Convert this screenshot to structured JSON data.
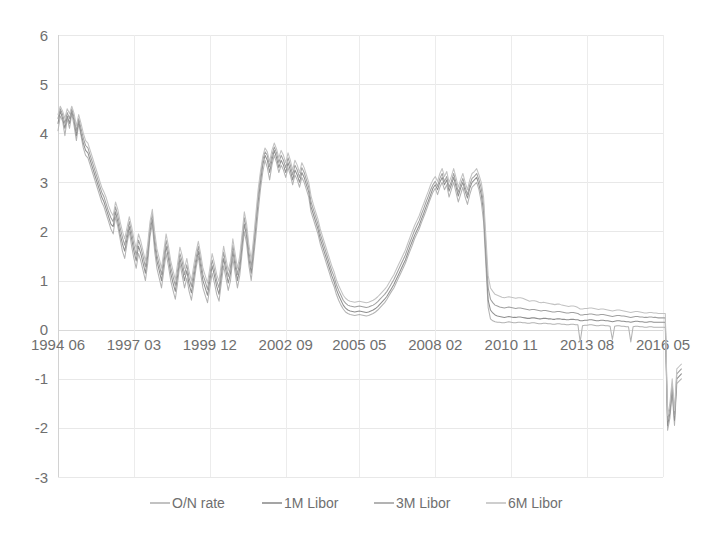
{
  "chart_data": {
    "type": "line",
    "title": "",
    "subtitle": "",
    "xlabel": "",
    "ylabel": "",
    "ylim": [
      -3,
      6
    ],
    "ytick_labels": [
      "6",
      "5",
      "4",
      "3",
      "2",
      "1",
      "0",
      "-1",
      "-2",
      "-3"
    ],
    "ytick_values": [
      6,
      5,
      4,
      3,
      2,
      1,
      0,
      -1,
      -2,
      -3
    ],
    "grid": true,
    "grid_axis": "both",
    "legend_position": "bottom",
    "xtick_labels": [
      "1994 06",
      "1997 03",
      "1999 12",
      "2002 09",
      "2005 05",
      "2008 02",
      "2010 11",
      "2013 08",
      "2016 05"
    ],
    "xtick_index": [
      0,
      33,
      66,
      99,
      131,
      164,
      197,
      230,
      263
    ],
    "x_axis_label_position": "at-zero-line",
    "n_points": 264,
    "x_start": "1994 06",
    "x_end": "2016 05",
    "series": [
      {
        "name": "O/N rate",
        "color": "#b3b3b3",
        "values": [
          4.05,
          4.35,
          4.25,
          3.95,
          4.3,
          4.1,
          4.4,
          4.15,
          3.85,
          4.2,
          3.95,
          3.7,
          3.55,
          3.5,
          3.35,
          3.2,
          3.05,
          2.9,
          2.75,
          2.6,
          2.5,
          2.35,
          2.2,
          2.05,
          1.95,
          2.3,
          2.1,
          1.85,
          1.6,
          1.45,
          1.75,
          2.0,
          1.7,
          1.45,
          1.25,
          1.55,
          1.4,
          1.2,
          1.0,
          1.35,
          1.9,
          2.15,
          1.6,
          1.25,
          1.05,
          0.85,
          1.2,
          1.55,
          1.3,
          1.0,
          0.8,
          0.62,
          0.95,
          1.35,
          1.1,
          0.85,
          1.05,
          0.78,
          0.6,
          0.9,
          1.25,
          1.5,
          1.15,
          0.85,
          0.7,
          0.55,
          0.85,
          1.15,
          0.95,
          0.72,
          0.58,
          0.95,
          1.3,
          1.05,
          0.8,
          1.0,
          1.45,
          1.15,
          0.85,
          1.1,
          1.55,
          2.0,
          1.75,
          1.3,
          1.0,
          1.45,
          1.9,
          2.4,
          2.85,
          3.2,
          3.45,
          3.3,
          3.05,
          3.35,
          3.55,
          3.4,
          3.2,
          3.35,
          3.25,
          3.1,
          3.3,
          3.15,
          2.95,
          3.15,
          3.05,
          2.9,
          3.1,
          3.0,
          2.85,
          2.7,
          2.4,
          2.25,
          2.1,
          1.95,
          1.75,
          1.6,
          1.45,
          1.3,
          1.15,
          1.0,
          0.88,
          0.72,
          0.6,
          0.5,
          0.42,
          0.36,
          0.33,
          0.31,
          0.3,
          0.29,
          0.3,
          0.31,
          0.3,
          0.29,
          0.28,
          0.29,
          0.31,
          0.33,
          0.36,
          0.4,
          0.45,
          0.5,
          0.55,
          0.62,
          0.7,
          0.78,
          0.85,
          0.95,
          1.05,
          1.15,
          1.25,
          1.35,
          1.48,
          1.6,
          1.72,
          1.85,
          1.95,
          2.05,
          2.18,
          2.3,
          2.42,
          2.55,
          2.68,
          2.8,
          2.88,
          2.75,
          2.9,
          3.0,
          2.85,
          2.95,
          2.7,
          2.85,
          3.0,
          2.8,
          2.6,
          2.75,
          2.9,
          2.7,
          2.55,
          2.75,
          2.9,
          2.95,
          3.0,
          2.85,
          2.6,
          2.2,
          1.3,
          0.45,
          0.22,
          0.18,
          0.16,
          0.15,
          0.15,
          0.14,
          0.14,
          0.15,
          0.16,
          0.15,
          0.14,
          0.14,
          0.15,
          0.15,
          0.14,
          0.14,
          0.13,
          0.13,
          0.14,
          0.14,
          0.13,
          0.12,
          0.12,
          0.13,
          0.13,
          0.12,
          0.12,
          0.11,
          0.11,
          0.12,
          0.12,
          0.11,
          0.11,
          0.1,
          0.1,
          0.11,
          0.11,
          0.1,
          0.1,
          -0.25,
          0.08,
          0.09,
          0.09,
          0.1,
          0.1,
          0.09,
          0.08,
          0.08,
          0.09,
          0.09,
          0.08,
          0.08,
          0.07,
          -0.2,
          0.07,
          0.08,
          0.08,
          0.07,
          0.07,
          0.06,
          0.06,
          -0.25,
          0.06,
          0.07,
          0.07,
          0.06,
          0.06,
          0.05,
          0.05,
          0.06,
          0.06,
          0.05,
          0.05,
          0.05,
          0.05,
          0.05,
          0.05,
          -2.05,
          -1.8,
          -1.3,
          -1.95,
          -1.1,
          -1.05,
          -1.0
        ]
      },
      {
        "name": "1M Libor",
        "color": "#8f8f8f",
        "values": [
          4.2,
          4.45,
          4.3,
          4.1,
          4.35,
          4.2,
          4.45,
          4.25,
          3.95,
          4.25,
          4.0,
          3.8,
          3.65,
          3.6,
          3.45,
          3.3,
          3.15,
          3.0,
          2.85,
          2.7,
          2.6,
          2.45,
          2.3,
          2.15,
          2.1,
          2.4,
          2.2,
          1.95,
          1.75,
          1.6,
          1.85,
          2.1,
          1.85,
          1.6,
          1.4,
          1.7,
          1.55,
          1.35,
          1.15,
          1.5,
          2.0,
          2.25,
          1.75,
          1.4,
          1.2,
          1.0,
          1.35,
          1.7,
          1.45,
          1.15,
          0.95,
          0.78,
          1.1,
          1.45,
          1.25,
          1.0,
          1.2,
          0.92,
          0.75,
          1.05,
          1.35,
          1.6,
          1.3,
          1.0,
          0.85,
          0.7,
          1.0,
          1.3,
          1.1,
          0.88,
          0.72,
          1.1,
          1.45,
          1.2,
          0.95,
          1.15,
          1.6,
          1.3,
          1.0,
          1.25,
          1.7,
          2.15,
          1.9,
          1.45,
          1.15,
          1.6,
          2.1,
          2.6,
          3.0,
          3.35,
          3.55,
          3.45,
          3.2,
          3.45,
          3.65,
          3.5,
          3.3,
          3.45,
          3.35,
          3.2,
          3.4,
          3.25,
          3.05,
          3.25,
          3.15,
          3.0,
          3.2,
          3.1,
          2.95,
          2.8,
          2.5,
          2.35,
          2.2,
          2.05,
          1.85,
          1.7,
          1.55,
          1.4,
          1.25,
          1.1,
          0.98,
          0.82,
          0.7,
          0.6,
          0.5,
          0.44,
          0.4,
          0.38,
          0.37,
          0.36,
          0.37,
          0.38,
          0.37,
          0.36,
          0.35,
          0.36,
          0.38,
          0.4,
          0.43,
          0.47,
          0.52,
          0.57,
          0.62,
          0.68,
          0.76,
          0.84,
          0.92,
          1.02,
          1.12,
          1.22,
          1.32,
          1.42,
          1.55,
          1.68,
          1.8,
          1.92,
          2.02,
          2.12,
          2.25,
          2.37,
          2.5,
          2.62,
          2.75,
          2.88,
          2.95,
          2.85,
          3.0,
          3.1,
          2.95,
          3.05,
          2.82,
          2.95,
          3.1,
          2.92,
          2.72,
          2.88,
          3.0,
          2.82,
          2.68,
          2.88,
          3.0,
          3.05,
          3.1,
          2.95,
          2.75,
          2.4,
          1.5,
          0.6,
          0.4,
          0.34,
          0.3,
          0.28,
          0.27,
          0.26,
          0.25,
          0.26,
          0.27,
          0.26,
          0.25,
          0.25,
          0.26,
          0.26,
          0.25,
          0.24,
          0.23,
          0.23,
          0.24,
          0.24,
          0.23,
          0.22,
          0.22,
          0.23,
          0.23,
          0.22,
          0.22,
          0.21,
          0.21,
          0.22,
          0.22,
          0.21,
          0.21,
          0.2,
          0.2,
          0.21,
          0.21,
          0.2,
          0.2,
          0.18,
          0.18,
          0.19,
          0.19,
          0.2,
          0.2,
          0.19,
          0.18,
          0.18,
          0.19,
          0.19,
          0.18,
          0.18,
          0.17,
          0.16,
          0.17,
          0.18,
          0.18,
          0.17,
          0.17,
          0.16,
          0.16,
          0.15,
          0.16,
          0.17,
          0.17,
          0.16,
          0.16,
          0.15,
          0.15,
          0.16,
          0.16,
          0.15,
          0.15,
          0.15,
          0.15,
          0.15,
          0.15,
          -1.95,
          -1.7,
          -1.2,
          -1.85,
          -1.0,
          -0.95,
          -0.9
        ]
      },
      {
        "name": "3M Libor",
        "color": "#a0a0a0",
        "values": [
          4.3,
          4.5,
          4.38,
          4.2,
          4.42,
          4.3,
          4.5,
          4.32,
          4.05,
          4.3,
          4.1,
          3.9,
          3.75,
          3.7,
          3.55,
          3.4,
          3.25,
          3.1,
          2.95,
          2.8,
          2.7,
          2.55,
          2.4,
          2.28,
          2.2,
          2.5,
          2.32,
          2.08,
          1.88,
          1.72,
          1.95,
          2.2,
          1.98,
          1.72,
          1.52,
          1.82,
          1.68,
          1.48,
          1.28,
          1.62,
          2.1,
          2.35,
          1.88,
          1.52,
          1.32,
          1.12,
          1.48,
          1.82,
          1.58,
          1.28,
          1.08,
          0.9,
          1.22,
          1.55,
          1.38,
          1.12,
          1.32,
          1.05,
          0.88,
          1.18,
          1.45,
          1.7,
          1.42,
          1.12,
          0.98,
          0.82,
          1.12,
          1.42,
          1.22,
          1.0,
          0.85,
          1.22,
          1.58,
          1.32,
          1.08,
          1.28,
          1.72,
          1.42,
          1.12,
          1.38,
          1.82,
          2.28,
          2.02,
          1.58,
          1.28,
          1.72,
          2.22,
          2.72,
          3.12,
          3.45,
          3.62,
          3.55,
          3.32,
          3.55,
          3.72,
          3.6,
          3.4,
          3.55,
          3.45,
          3.3,
          3.5,
          3.35,
          3.15,
          3.35,
          3.25,
          3.1,
          3.3,
          3.2,
          3.05,
          2.9,
          2.6,
          2.45,
          2.3,
          2.15,
          1.95,
          1.8,
          1.65,
          1.5,
          1.35,
          1.2,
          1.08,
          0.92,
          0.8,
          0.7,
          0.6,
          0.54,
          0.5,
          0.48,
          0.47,
          0.46,
          0.47,
          0.48,
          0.47,
          0.46,
          0.45,
          0.46,
          0.48,
          0.5,
          0.53,
          0.57,
          0.62,
          0.67,
          0.72,
          0.78,
          0.86,
          0.94,
          1.02,
          1.12,
          1.22,
          1.32,
          1.42,
          1.52,
          1.65,
          1.78,
          1.9,
          2.02,
          2.12,
          2.22,
          2.35,
          2.47,
          2.6,
          2.72,
          2.85,
          2.95,
          3.02,
          2.92,
          3.08,
          3.18,
          3.02,
          3.12,
          2.9,
          3.02,
          3.18,
          3.0,
          2.8,
          2.95,
          3.08,
          2.9,
          2.75,
          2.95,
          3.08,
          3.12,
          3.18,
          3.05,
          2.88,
          2.55,
          1.7,
          0.85,
          0.62,
          0.55,
          0.5,
          0.48,
          0.46,
          0.45,
          0.44,
          0.45,
          0.46,
          0.45,
          0.44,
          0.43,
          0.44,
          0.44,
          0.43,
          0.42,
          0.41,
          0.4,
          0.41,
          0.41,
          0.4,
          0.39,
          0.38,
          0.39,
          0.39,
          0.38,
          0.37,
          0.36,
          0.36,
          0.37,
          0.37,
          0.36,
          0.35,
          0.34,
          0.34,
          0.35,
          0.35,
          0.34,
          0.33,
          0.3,
          0.3,
          0.31,
          0.31,
          0.32,
          0.32,
          0.31,
          0.3,
          0.3,
          0.31,
          0.31,
          0.3,
          0.29,
          0.28,
          0.27,
          0.28,
          0.29,
          0.29,
          0.28,
          0.28,
          0.27,
          0.26,
          0.25,
          0.26,
          0.27,
          0.27,
          0.26,
          0.26,
          0.25,
          0.25,
          0.26,
          0.26,
          0.25,
          0.25,
          0.24,
          0.24,
          0.24,
          0.24,
          -1.85,
          -1.6,
          -1.1,
          -1.75,
          -0.9,
          -0.85,
          -0.8
        ]
      },
      {
        "name": "6M Libor",
        "color": "#c2c2c2",
        "values": [
          4.38,
          4.55,
          4.45,
          4.3,
          4.5,
          4.4,
          4.55,
          4.4,
          4.15,
          4.38,
          4.2,
          4.0,
          3.85,
          3.8,
          3.65,
          3.5,
          3.35,
          3.2,
          3.05,
          2.9,
          2.8,
          2.68,
          2.52,
          2.4,
          2.32,
          2.6,
          2.45,
          2.2,
          2.0,
          1.85,
          2.08,
          2.3,
          2.1,
          1.85,
          1.65,
          1.95,
          1.8,
          1.6,
          1.4,
          1.75,
          2.2,
          2.45,
          2.0,
          1.65,
          1.45,
          1.25,
          1.6,
          1.95,
          1.7,
          1.4,
          1.2,
          1.02,
          1.35,
          1.68,
          1.5,
          1.25,
          1.45,
          1.18,
          1.0,
          1.3,
          1.58,
          1.8,
          1.55,
          1.25,
          1.1,
          0.95,
          1.25,
          1.55,
          1.35,
          1.12,
          0.98,
          1.35,
          1.7,
          1.45,
          1.2,
          1.4,
          1.85,
          1.55,
          1.25,
          1.5,
          1.95,
          2.4,
          2.15,
          1.72,
          1.42,
          1.85,
          2.35,
          2.85,
          3.22,
          3.52,
          3.7,
          3.62,
          3.42,
          3.65,
          3.8,
          3.68,
          3.5,
          3.65,
          3.55,
          3.4,
          3.6,
          3.45,
          3.25,
          3.45,
          3.35,
          3.2,
          3.4,
          3.3,
          3.15,
          3.0,
          2.72,
          2.55,
          2.4,
          2.25,
          2.05,
          1.9,
          1.75,
          1.6,
          1.45,
          1.3,
          1.18,
          1.02,
          0.9,
          0.8,
          0.7,
          0.64,
          0.6,
          0.58,
          0.57,
          0.56,
          0.57,
          0.58,
          0.57,
          0.56,
          0.55,
          0.56,
          0.58,
          0.6,
          0.63,
          0.67,
          0.72,
          0.77,
          0.82,
          0.88,
          0.96,
          1.04,
          1.12,
          1.22,
          1.32,
          1.42,
          1.52,
          1.62,
          1.75,
          1.88,
          2.0,
          2.12,
          2.22,
          2.32,
          2.45,
          2.57,
          2.7,
          2.82,
          2.95,
          3.05,
          3.12,
          3.02,
          3.18,
          3.28,
          3.12,
          3.22,
          3.0,
          3.12,
          3.28,
          3.1,
          2.9,
          3.05,
          3.18,
          3.0,
          2.85,
          3.05,
          3.18,
          3.22,
          3.28,
          3.15,
          3.0,
          2.7,
          1.9,
          1.1,
          0.85,
          0.78,
          0.72,
          0.7,
          0.68,
          0.66,
          0.65,
          0.66,
          0.67,
          0.66,
          0.65,
          0.64,
          0.65,
          0.65,
          0.64,
          0.62,
          0.6,
          0.58,
          0.59,
          0.59,
          0.58,
          0.56,
          0.55,
          0.56,
          0.55,
          0.54,
          0.53,
          0.52,
          0.51,
          0.52,
          0.52,
          0.5,
          0.49,
          0.48,
          0.47,
          0.48,
          0.48,
          0.47,
          0.45,
          0.42,
          0.42,
          0.43,
          0.43,
          0.44,
          0.44,
          0.43,
          0.42,
          0.41,
          0.42,
          0.42,
          0.41,
          0.4,
          0.39,
          0.38,
          0.39,
          0.4,
          0.4,
          0.39,
          0.38,
          0.37,
          0.36,
          0.35,
          0.36,
          0.37,
          0.37,
          0.36,
          0.35,
          0.34,
          0.34,
          0.35,
          0.35,
          0.34,
          0.34,
          0.33,
          0.33,
          0.33,
          0.33,
          -1.75,
          -1.5,
          -1.0,
          -1.65,
          -0.8,
          -0.75,
          -0.7
        ]
      }
    ]
  },
  "legend": {
    "items": [
      {
        "label": "O/N rate"
      },
      {
        "label": "1M Libor"
      },
      {
        "label": "3M Libor"
      },
      {
        "label": "6M Libor"
      }
    ]
  },
  "colors": {
    "gridline": "#e8e8e8",
    "axis": "#d2d2d2",
    "tick_text": "#6f6f6f"
  }
}
